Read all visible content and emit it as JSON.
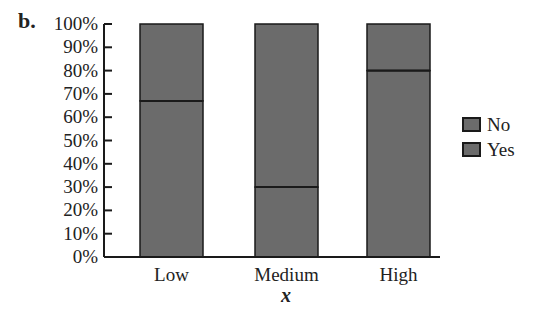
{
  "figure": {
    "panel_label": "b."
  },
  "chart_data": {
    "type": "bar",
    "stacked": true,
    "normalized": true,
    "title": "",
    "xlabel": "x",
    "ylabel": "",
    "categories": [
      "Low",
      "Medium",
      "High"
    ],
    "series": [
      {
        "name": "Yes",
        "values": [
          67,
          30,
          80
        ],
        "color": "#6b6b6b"
      },
      {
        "name": "No",
        "values": [
          33,
          70,
          20
        ],
        "color": "#6b6b6b"
      }
    ],
    "ylim": [
      0,
      100
    ],
    "yticks": [
      0,
      10,
      20,
      30,
      40,
      50,
      60,
      70,
      80,
      90,
      100
    ],
    "ytick_labels": [
      "0%",
      "10%",
      "20%",
      "30%",
      "40%",
      "50%",
      "60%",
      "70%",
      "80%",
      "90%",
      "100%"
    ],
    "grid": false,
    "legend": {
      "position": "right",
      "entries": [
        {
          "label": "No",
          "color": "#6b6b6b"
        },
        {
          "label": "Yes",
          "color": "#6b6b6b"
        }
      ]
    }
  },
  "style": {
    "bar_fill": "#6b6b6b",
    "bar_stroke": "#1a1a1a",
    "axis_color": "#1a1a1a"
  }
}
